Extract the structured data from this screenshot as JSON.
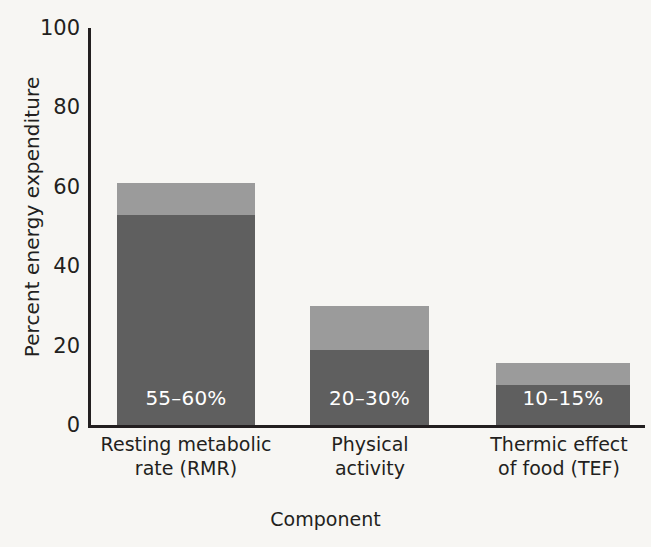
{
  "chart_data": {
    "type": "bar",
    "subtype": "stacked-range-bar",
    "title": "",
    "xlabel": "Component",
    "ylabel": "Percent energy expenditure",
    "ylim": [
      0,
      100
    ],
    "yticks": [
      0,
      20,
      40,
      60,
      80,
      100
    ],
    "ytick_labels": [
      "0",
      "20",
      "40",
      "60",
      "80",
      "100"
    ],
    "grid": false,
    "legend": "none",
    "categories": [
      "Resting metabolic rate (RMR)",
      "Physical activity",
      "Thermic effect of food (TEF)"
    ],
    "category_lines": [
      [
        "Resting metabolic",
        "rate (RMR)"
      ],
      [
        "Physical",
        "activity"
      ],
      [
        "Thermic effect",
        "of food (TEF)"
      ]
    ],
    "series": [
      {
        "name": "lower bound",
        "values": [
          53,
          19,
          10
        ],
        "color": "#5f5f5f"
      },
      {
        "name": "upper extent",
        "values": [
          61,
          30,
          15.5
        ],
        "color": "#9b9b9b"
      }
    ],
    "ranges": [
      {
        "category": "Resting metabolic rate (RMR)",
        "low": 55,
        "high": 60,
        "label": "55–60%"
      },
      {
        "category": "Physical activity",
        "low": 20,
        "high": 30,
        "label": "20–30%"
      },
      {
        "category": "Thermic effect of food (TEF)",
        "low": 10,
        "high": 15,
        "label": "10–15%"
      }
    ],
    "data_labels": [
      "55–60%",
      "20–30%",
      "10–15%"
    ],
    "colors": {
      "dark_segment": "#5f5f5f",
      "light_segment": "#9b9b9b",
      "axis": "#231f20",
      "background": "#f7f6f3",
      "data_label_text": "#ffffff"
    }
  },
  "axes": {
    "y": {
      "title": "Percent energy expenditure",
      "ticks": [
        "100",
        "80",
        "60",
        "40",
        "20",
        "0"
      ]
    },
    "x": {
      "title": "Component"
    }
  },
  "bars": [
    {
      "name": "rmr",
      "label": "55–60%",
      "dark_top": 53,
      "light_top": 61,
      "line1": "Resting metabolic",
      "line2": "rate (RMR)"
    },
    {
      "name": "physical-activity",
      "label": "20–30%",
      "dark_top": 19,
      "light_top": 30,
      "line1": "Physical",
      "line2": "activity"
    },
    {
      "name": "tef",
      "label": "10–15%",
      "dark_top": 10,
      "light_top": 15.5,
      "line1": "Thermic effect",
      "line2": "of food (TEF)"
    }
  ]
}
